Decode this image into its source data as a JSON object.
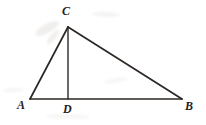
{
  "figure": {
    "kind": "geometry-diagram",
    "canvas": {
      "width": 206,
      "height": 125
    },
    "background_color": "#ffffff",
    "stroke_color": "#2b2724",
    "label_color": "#23201f",
    "points": {
      "A": {
        "x": 30,
        "y": 99,
        "label": "A",
        "label_x": 17,
        "label_y": 99
      },
      "B": {
        "x": 182,
        "y": 99,
        "label": "B",
        "label_x": 185,
        "label_y": 100
      },
      "C": {
        "x": 68,
        "y": 27,
        "label": "C",
        "label_x": 62,
        "label_y": 5
      },
      "D": {
        "x": 68,
        "y": 99,
        "label": "D",
        "label_x": 63,
        "label_y": 103
      }
    },
    "segments": [
      {
        "name": "side-AB",
        "from": "A",
        "to": "B",
        "width": 1.7
      },
      {
        "name": "side-AC",
        "from": "A",
        "to": "C",
        "width": 1.7
      },
      {
        "name": "side-CB",
        "from": "C",
        "to": "B",
        "width": 1.7
      },
      {
        "name": "altitude-CD",
        "from": "C",
        "to": "D",
        "width": 1.4
      }
    ]
  },
  "labels": {
    "A": "A",
    "B": "B",
    "C": "C",
    "D": "D"
  }
}
